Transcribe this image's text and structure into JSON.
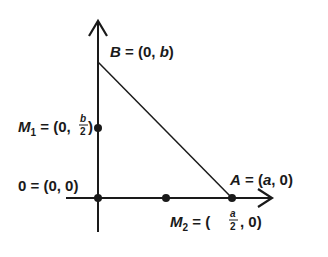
{
  "diagram": {
    "type": "coordinate-triangle",
    "points": {
      "B": {
        "name": "B",
        "label_eq": " = (0, ",
        "coord": "b",
        "close": ")"
      },
      "M1": {
        "name": "M",
        "sub": "1",
        "label_eq": " = (0,",
        "frac_num": "b",
        "frac_den": "2",
        "close": ")"
      },
      "O": {
        "label": "0 = (0, 0)"
      },
      "A": {
        "name": "A",
        "label_eq": " = (",
        "coord": "a",
        "close": ", 0)"
      },
      "M2": {
        "name": "M",
        "sub": "2",
        "label_eq": " = (",
        "frac_num": "a",
        "frac_den": "2",
        "close": ", 0)"
      }
    },
    "colors": {
      "stroke": "#1a1a1a",
      "background": "#ffffff"
    }
  }
}
